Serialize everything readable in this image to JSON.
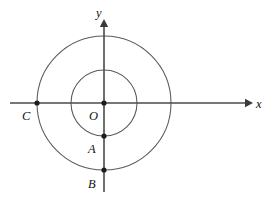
{
  "figure": {
    "background_color": "#ffffff",
    "width": 272,
    "height": 197
  },
  "axes": {
    "x_axis": {
      "label": "x",
      "label_x": 256,
      "label_y": 108,
      "line_x1": 10,
      "line_x2": 248,
      "line_y": 103,
      "arrow_tip_x": 253,
      "arrow_direction": "right",
      "color": "#4a4a4a"
    },
    "y_axis": {
      "label": "y",
      "label_x": 96,
      "label_y": 17,
      "line_x": 104,
      "line_y1": 24,
      "line_y2": 192,
      "arrow_tip_y": 19,
      "arrow_direction": "up",
      "color": "#4a4a4a"
    }
  },
  "circles": [
    {
      "name": "large-circle",
      "center_x": 104,
      "center_y": 103,
      "radius": 67,
      "color": "#5a5a5a"
    },
    {
      "name": "small-circle",
      "center_x": 104,
      "center_y": 103,
      "radius": 33,
      "color": "#5a5a5a"
    }
  ],
  "points": [
    {
      "name": "origin",
      "label": "O",
      "x": 104,
      "y": 103,
      "label_x": 89,
      "label_y": 120,
      "dot_radius": 2.6,
      "description": "origin, common center of both circles"
    },
    {
      "name": "point-c",
      "label": "C",
      "x": 37,
      "y": 103,
      "label_x": 22,
      "label_y": 120,
      "dot_radius": 2.6,
      "description": "left intersection of large circle with x-axis"
    },
    {
      "name": "point-a",
      "label": "A",
      "x": 104,
      "y": 136,
      "label_x": 88,
      "label_y": 153,
      "dot_radius": 2.6,
      "description": "bottom intersection of small circle with y-axis"
    },
    {
      "name": "point-b",
      "label": "B",
      "x": 104,
      "y": 170,
      "label_x": 88,
      "label_y": 188,
      "dot_radius": 2.6,
      "description": "bottom intersection of large circle with y-axis"
    }
  ],
  "chart_data": {
    "type": "scatter",
    "title": "",
    "xlabel": "x",
    "ylabel": "y",
    "grid": false,
    "legend": "none",
    "center": [
      0,
      0
    ],
    "radii": {
      "large": 67,
      "small": 33
    },
    "labeled_points": {
      "O": [
        0,
        0
      ],
      "C": [
        -67,
        0
      ],
      "A": [
        0,
        -33
      ],
      "B": [
        0,
        -67
      ]
    }
  }
}
